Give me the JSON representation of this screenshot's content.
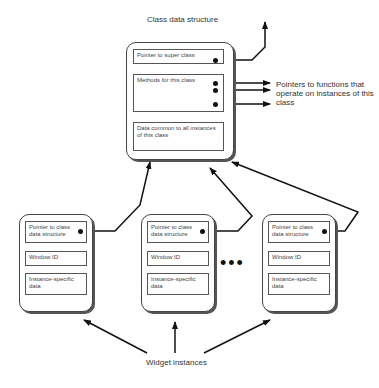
{
  "title": "Class data structure",
  "class_box": {
    "fields": [
      "Pointer to super class",
      "Methods for this class",
      "Data common to all instances of this class"
    ]
  },
  "methods_annotation": "Pointers to functions that operate on instances of this class",
  "instances": [
    {
      "fields": [
        "Pointer to class data structure",
        "Window ID",
        "Instance-specific data"
      ]
    },
    {
      "fields": [
        "Pointer to class data structure",
        "Window ID",
        "Instance-specific data"
      ]
    },
    {
      "fields": [
        "Pointer to class data structure",
        "Window ID",
        "Instance-specific data"
      ]
    }
  ],
  "ellipsis": "•••",
  "bottom_label": "Widget instances"
}
